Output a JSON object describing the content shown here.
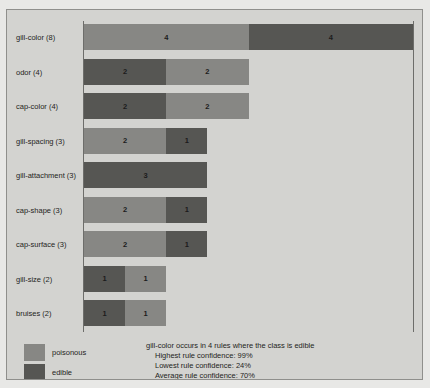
{
  "chart_data": {
    "type": "bar",
    "orientation": "horizontal",
    "stacked": true,
    "title": "",
    "xlabel": "",
    "ylabel": "",
    "xlim": [
      0,
      8
    ],
    "grid": false,
    "legend_position": "bottom-left",
    "categories": [
      "gill-color (8)",
      "odor (4)",
      "cap-color (4)",
      "gill-spacing (3)",
      "gill-attachment (3)",
      "cap-shape (3)",
      "cap-surface (3)",
      "gill-size (2)",
      "bruises (2)"
    ],
    "category_totals": [
      8,
      4,
      4,
      3,
      3,
      3,
      3,
      2,
      2
    ],
    "series": [
      {
        "name": "poisonous",
        "color": "#878784",
        "values": [
          4,
          2,
          2,
          2,
          0,
          2,
          2,
          1,
          1
        ]
      },
      {
        "name": "edible",
        "color": "#565653",
        "values": [
          4,
          2,
          2,
          1,
          3,
          1,
          1,
          1,
          1
        ]
      }
    ],
    "bars": [
      {
        "category": "gill-color (8)",
        "total": 8,
        "segments": [
          {
            "series": "poisonous",
            "value": 4,
            "label": "4"
          },
          {
            "series": "edible",
            "value": 4,
            "label": "4"
          }
        ]
      },
      {
        "category": "odor (4)",
        "total": 4,
        "segments": [
          {
            "series": "edible",
            "value": 2,
            "label": "2"
          },
          {
            "series": "poisonous",
            "value": 2,
            "label": "2"
          }
        ]
      },
      {
        "category": "cap-color (4)",
        "total": 4,
        "segments": [
          {
            "series": "edible",
            "value": 2,
            "label": "2"
          },
          {
            "series": "poisonous",
            "value": 2,
            "label": "2"
          }
        ]
      },
      {
        "category": "gill-spacing (3)",
        "total": 3,
        "segments": [
          {
            "series": "poisonous",
            "value": 2,
            "label": "2"
          },
          {
            "series": "edible",
            "value": 1,
            "label": "1"
          }
        ]
      },
      {
        "category": "gill-attachment (3)",
        "total": 3,
        "segments": [
          {
            "series": "edible",
            "value": 3,
            "label": "3"
          }
        ]
      },
      {
        "category": "cap-shape (3)",
        "total": 3,
        "segments": [
          {
            "series": "poisonous",
            "value": 2,
            "label": "2"
          },
          {
            "series": "edible",
            "value": 1,
            "label": "1"
          }
        ]
      },
      {
        "category": "cap-surface (3)",
        "total": 3,
        "segments": [
          {
            "series": "poisonous",
            "value": 2,
            "label": "2"
          },
          {
            "series": "edible",
            "value": 1,
            "label": "1"
          }
        ]
      },
      {
        "category": "gill-size (2)",
        "total": 2,
        "segments": [
          {
            "series": "edible",
            "value": 1,
            "label": "1"
          },
          {
            "series": "poisonous",
            "value": 1,
            "label": "1"
          }
        ]
      },
      {
        "category": "bruises (2)",
        "total": 2,
        "segments": [
          {
            "series": "edible",
            "value": 1,
            "label": "1"
          },
          {
            "series": "poisonous",
            "value": 1,
            "label": "1"
          }
        ]
      }
    ],
    "legend": [
      {
        "label": "poisonous",
        "color": "#878784"
      },
      {
        "label": "edible",
        "color": "#565653"
      }
    ],
    "annotations": {
      "headline": "gill-color occurs in 4 rules where the class is edible",
      "lines": [
        "Highest rule confidence: 99%",
        "Lowest rule confidence: 24%",
        "Average rule confidence: 70%"
      ],
      "highest_rule_confidence": "99%",
      "lowest_rule_confidence": "24%",
      "average_rule_confidence": "70%"
    }
  },
  "colors": {
    "page_background": "#e8e8e6",
    "panel_background": "#d3d3d0",
    "panel_border": "#8f8f8c",
    "axis": "#6d6d6a",
    "poisonous": "#878784",
    "edible": "#565653",
    "text": "#242422"
  }
}
